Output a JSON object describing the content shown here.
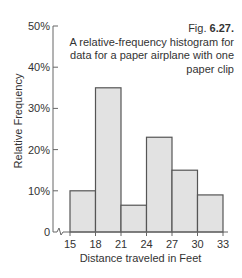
{
  "caption": {
    "fig_prefix": "Fig. ",
    "fig_number": "6.27.",
    "text": "A relative-frequency histogram for data for a paper airplane with one paper clip"
  },
  "colors": {
    "bar_fill": "#e2e2e2",
    "bar_stroke": "#555555",
    "axis": "#666666",
    "text": "#333333"
  },
  "chart_data": {
    "type": "bar",
    "title": "Fig. 6.27. A relative-frequency histogram for data for a paper airplane with one paper clip",
    "xlabel": "Distance traveled in Feet",
    "ylabel": "Relative Frequency",
    "bin_edges": [
      15,
      18,
      21,
      24,
      27,
      30,
      33
    ],
    "categories": [
      "15-18",
      "18-21",
      "21-24",
      "24-27",
      "27-30",
      "30-33"
    ],
    "values": [
      10,
      35,
      6.5,
      23,
      15,
      9
    ],
    "value_unit": "%",
    "ylim": [
      0,
      50
    ],
    "yticks": [
      0,
      10,
      20,
      30,
      40,
      50
    ],
    "ytick_labels": [
      "0",
      "10%",
      "20%",
      "30%",
      "40%",
      "50%"
    ],
    "xtick_labels": [
      "15",
      "18",
      "21",
      "24",
      "27",
      "30",
      "33"
    ],
    "axis_break": true,
    "grid": false,
    "legend": null
  }
}
